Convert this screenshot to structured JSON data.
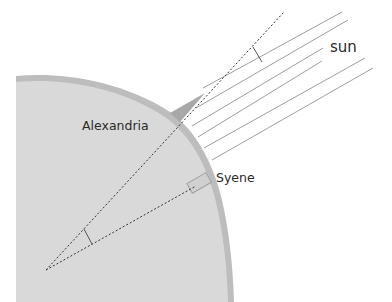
{
  "diagram": {
    "labels": {
      "alexandria": "Alexandria",
      "syene": "Syene",
      "sun": "sun"
    },
    "elements": {
      "earth": "Earth cross-section (gray)",
      "sun_rays": "6 parallel sunlight rays",
      "gnomon": "Obelisk / shadow stick at Alexandria",
      "well": "Well at Syene",
      "angle_at_alexandria": "shadow angle",
      "angle_at_center": "central angle"
    },
    "colors": {
      "earth_fill": "#d9d9d9",
      "earth_rim": "#bdbdbd",
      "ray_stroke": "#9a9a9a",
      "dashed_line": "#333333",
      "text": "#2a2a2a"
    }
  }
}
